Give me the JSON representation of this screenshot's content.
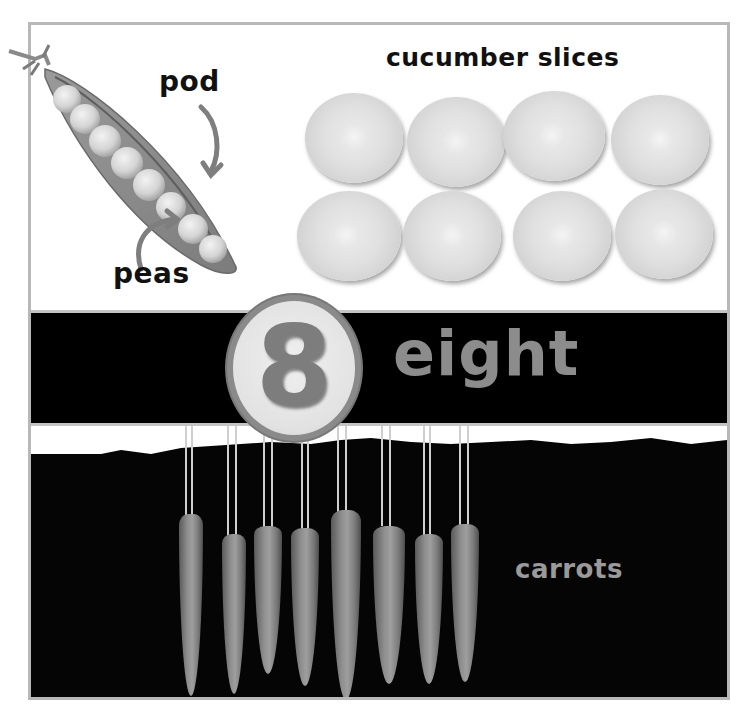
{
  "top_panel": {
    "pea_labels": {
      "pod": "pod",
      "peas": "peas"
    },
    "cucumber_title": "cucumber slices",
    "cucumber_count": 8,
    "pea_count": 8
  },
  "number_band": {
    "numeral": "8",
    "word": "eight"
  },
  "bottom_panel": {
    "carrots_label": "carrots",
    "carrot_count": 8
  },
  "colors": {
    "frame_border": "#b8b8b8",
    "band_background": "#000000",
    "numeral": "#7d7d7d",
    "word": "#8c8c8c",
    "label_text": "#111111",
    "carrots_label": "#9a9a9a"
  }
}
